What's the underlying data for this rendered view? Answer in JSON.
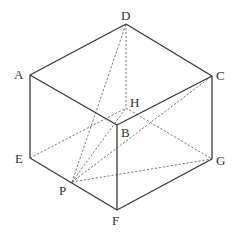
{
  "diagram": {
    "type": "cube-geometry",
    "vertices": {
      "A": {
        "x": 30,
        "y": 75
      },
      "B": {
        "x": 117,
        "y": 125
      },
      "C": {
        "x": 212,
        "y": 76
      },
      "D": {
        "x": 126,
        "y": 24
      },
      "E": {
        "x": 30,
        "y": 158
      },
      "F": {
        "x": 117,
        "y": 210
      },
      "G": {
        "x": 212,
        "y": 159
      },
      "H": {
        "x": 126,
        "y": 108
      },
      "P": {
        "x": 72,
        "y": 182
      }
    },
    "labels": {
      "A": "A",
      "B": "B",
      "C": "C",
      "D": "D",
      "E": "E",
      "F": "F",
      "G": "G",
      "H": "H",
      "P": "P"
    },
    "solid_edges": [
      [
        "A",
        "D"
      ],
      [
        "D",
        "C"
      ],
      [
        "A",
        "B"
      ],
      [
        "B",
        "C"
      ],
      [
        "A",
        "E"
      ],
      [
        "B",
        "F"
      ],
      [
        "C",
        "G"
      ],
      [
        "E",
        "F"
      ],
      [
        "F",
        "G"
      ]
    ],
    "dashed_edges": [
      [
        "D",
        "H"
      ],
      [
        "E",
        "H"
      ],
      [
        "H",
        "G"
      ],
      [
        "P",
        "D"
      ],
      [
        "P",
        "H"
      ],
      [
        "P",
        "C"
      ],
      [
        "P",
        "G"
      ]
    ]
  }
}
